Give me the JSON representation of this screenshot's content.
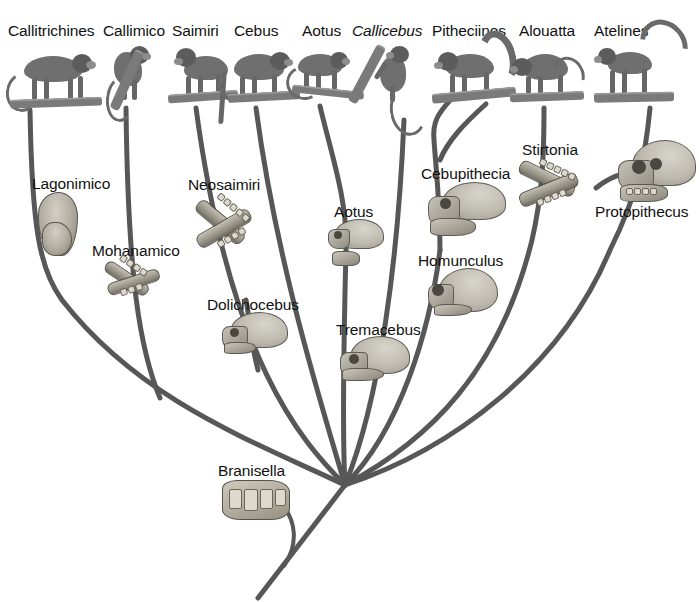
{
  "figure": {
    "kind": "phylogenetic-tree",
    "background_color": "#ffffff",
    "branch_color": "#575757",
    "label_color": "#111111"
  },
  "extant_taxa": [
    {
      "id": "callitrichines",
      "label": "Callitrichines",
      "label_x": 8,
      "label_y": 22,
      "art_x": 10,
      "art_y": 48
    },
    {
      "id": "callimico",
      "label": "Callimico",
      "label_x": 103,
      "label_y": 22,
      "art_x": 108,
      "art_y": 46
    },
    {
      "id": "saimiri",
      "label": "Saimiri",
      "label_x": 172,
      "label_y": 22,
      "art_x": 168,
      "art_y": 46
    },
    {
      "id": "cebus",
      "label": "Cebus",
      "label_x": 234,
      "label_y": 22,
      "art_x": 226,
      "art_y": 48
    },
    {
      "id": "aotus",
      "label": "Aotus",
      "label_x": 302,
      "label_y": 22,
      "art_x": 292,
      "art_y": 50
    },
    {
      "id": "callicebus",
      "label": "Callicebus",
      "label_x": 352,
      "label_y": 22,
      "art_x": 362,
      "art_y": 42,
      "italic": true
    },
    {
      "id": "pitheciines",
      "label": "Pitheciines",
      "label_x": 432,
      "label_y": 22,
      "art_x": 432,
      "art_y": 44
    },
    {
      "id": "alouatta",
      "label": "Alouatta",
      "label_x": 519,
      "label_y": 22,
      "art_x": 510,
      "art_y": 50
    },
    {
      "id": "atelines",
      "label": "Atelines",
      "label_x": 594,
      "label_y": 22,
      "art_x": 592,
      "art_y": 22
    }
  ],
  "fossil_taxa": [
    {
      "id": "lagonimico",
      "label": "Lagonimico",
      "label_x": 32,
      "label_y": 175,
      "art_x": 38,
      "art_y": 192
    },
    {
      "id": "mohanamico",
      "label": "Mohanamico",
      "label_x": 92,
      "label_y": 242,
      "art_x": 106,
      "art_y": 258
    },
    {
      "id": "neosaimiri",
      "label": "Neosaimiri",
      "label_x": 188,
      "label_y": 176,
      "art_x": 196,
      "art_y": 196
    },
    {
      "id": "dolichocebus",
      "label": "Dolichocebus",
      "label_x": 207,
      "label_y": 296,
      "art_x": 222,
      "art_y": 312
    },
    {
      "id": "aotus_fossil",
      "label": "Aotus",
      "label_x": 334,
      "label_y": 203,
      "art_x": 328,
      "art_y": 219
    },
    {
      "id": "tremacebus",
      "label": "Tremacebus",
      "label_x": 336,
      "label_y": 321,
      "art_x": 340,
      "art_y": 336
    },
    {
      "id": "cebupithecia",
      "label": "Cebupithecia",
      "label_x": 421,
      "label_y": 165,
      "art_x": 428,
      "art_y": 182
    },
    {
      "id": "homunculus",
      "label": "Homunculus",
      "label_x": 418,
      "label_y": 252,
      "art_x": 428,
      "art_y": 268
    },
    {
      "id": "stirtonia",
      "label": "Stirtonia",
      "label_x": 522,
      "label_y": 141,
      "art_x": 518,
      "art_y": 158
    },
    {
      "id": "protopithecus",
      "label": "Protopithecus",
      "label_x": 595,
      "label_y": 203,
      "art_x": 618,
      "art_y": 140
    },
    {
      "id": "branisella",
      "label": "Branisella",
      "label_x": 218,
      "label_y": 462,
      "art_x": 222,
      "art_y": 480
    }
  ],
  "topology": {
    "root_node": {
      "x": 345,
      "y": 485
    },
    "description": "Nine extant platyrrhine lineages radiate from a single basal node; fossil taxa are placed along the branches they are associated with.",
    "branch_count": 9
  }
}
